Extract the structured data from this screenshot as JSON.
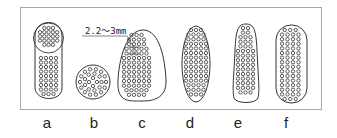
{
  "diagram": {
    "dimension_label": "2.2～3mm",
    "shapes": [
      {
        "id": "a",
        "label": "a",
        "description": "capsule with densely perforated circular top region"
      },
      {
        "id": "b",
        "label": "b",
        "description": "circle with concentric ring perforations"
      },
      {
        "id": "c",
        "label": "c",
        "description": "tapered shape, wider at bottom, with grid perforations"
      },
      {
        "id": "d",
        "label": "d",
        "description": "ellipse with grid perforations"
      },
      {
        "id": "e",
        "label": "e",
        "description": "narrow tapered shape, wider at bottom"
      },
      {
        "id": "f",
        "label": "f",
        "description": "stadium / rounded rectangle with grid perforations"
      }
    ],
    "colors": {
      "stroke": "#333333",
      "frame": "#a8a8a8"
    }
  }
}
